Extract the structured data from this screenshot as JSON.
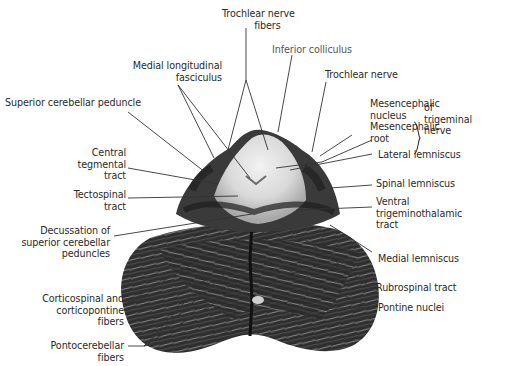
{
  "figure": {
    "labels": {
      "trochlear_nerve_fibers": [
        "Trochlear nerve",
        "fibers"
      ],
      "inferior_colliculus": [
        "Inferior colliculus"
      ],
      "medial_longitudinal_fasciculus": [
        "Medial  longitudinal",
        "fasciculus"
      ],
      "trochlear_nerve": [
        "Trochlear nerve"
      ],
      "superior_cerebellar_peduncle": [
        "Superior cerebellar peduncle"
      ],
      "mesencephalic_nucleus": [
        "Mesencephalic",
        "nucleus"
      ],
      "mesencephalic_root": [
        "Mesencephalic",
        "root"
      ],
      "of_trigeminal_nerve": [
        "of",
        "trigeminal",
        "nerve"
      ],
      "central_tegmental_tract": [
        "Central",
        "tegmental",
        "tract"
      ],
      "lateral_lemniscus": [
        "Lateral lemniscus"
      ],
      "spinal_lemniscus": [
        "Spinal lemniscus"
      ],
      "tectospinal_tract": [
        "Tectospinal",
        "tract"
      ],
      "ventral_trigeminothalamic_tract": [
        "Ventral",
        "trigeminothalamic",
        "tract"
      ],
      "decussation_scp": [
        "Decussation of",
        "superior cerebellar",
        "peduncles"
      ],
      "medial_lemniscus": [
        "Medial lemniscus"
      ],
      "corticospinal_fibers": [
        "Corticospinal and",
        "corticopontine",
        "fibers"
      ],
      "rubrospinal_tract": [
        "Rubrospinal tract"
      ],
      "pontine_nuclei": [
        "Pontine nuclei"
      ],
      "pontocerebellar_fibers": [
        "Pontocerebellar",
        "fibers"
      ]
    },
    "colors": {
      "background": "#ffffff",
      "text": "#2a2a2a",
      "leader_line": "#333333",
      "tissue_dark": "#2b2b2b",
      "tissue_mid": "#6e6e6e",
      "tissue_light": "#e8e8e8"
    }
  }
}
